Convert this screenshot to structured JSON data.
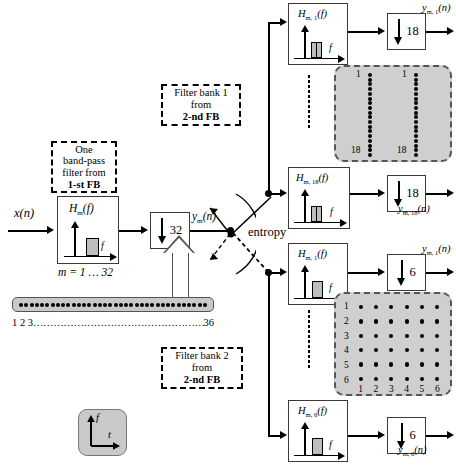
{
  "diagram": {
    "input_signal": "x(n)",
    "stage1": {
      "callout": {
        "line1": "One",
        "line2": "band-pass",
        "line3": "filter from",
        "line4": "1-st FB"
      },
      "filter_label": "H",
      "filter_sub": "m",
      "filter_arg": "(f)",
      "axis_f": "f",
      "index_note": "m = 1 … 32",
      "downsample": "32",
      "output": "y",
      "output_sub": "m",
      "output_arg": "(n)"
    },
    "switch": {
      "label": "entropy"
    },
    "bank1": {
      "callout": {
        "line1": "Filter bank 1",
        "line2": "from",
        "line3": "2-nd FB"
      },
      "branches": [
        {
          "filter_label": "H",
          "filter_sub": "m, 1",
          "filter_arg": "(f)",
          "axis_f": "f",
          "downsample": "18",
          "output_label": "y",
          "output_sub": "m, 1",
          "output_arg": "(n)"
        },
        {
          "filter_label": "H",
          "filter_sub": "m, 18",
          "filter_arg": "(f)",
          "axis_f": "f",
          "downsample": "18",
          "output_label": "y",
          "output_sub": "m, 18",
          "output_arg": "(n)"
        }
      ],
      "tiling": {
        "type": "columns",
        "columns": 2,
        "dots_per_column": 18,
        "col_top_label": "1",
        "col_bottom_label": "18"
      }
    },
    "bank2": {
      "callout": {
        "line1": "Filter bank 2",
        "line2": "from",
        "line3": "2-nd FB"
      },
      "branches": [
        {
          "filter_label": "H",
          "filter_sub": "m, 1",
          "filter_arg": "(f)",
          "axis_f": "f",
          "downsample": "6",
          "output_label": "y",
          "output_sub": "m, 1",
          "output_arg": "(n)"
        },
        {
          "filter_label": "H",
          "filter_sub": "m, 6",
          "filter_arg": "(f)",
          "axis_f": "f",
          "downsample": "6",
          "output_label": "y",
          "output_sub": "m, 6",
          "output_arg": "(n)"
        }
      ],
      "tiling": {
        "type": "grid",
        "rows": 6,
        "columns": 6,
        "row_labels": [
          "1",
          "2",
          "3",
          "4",
          "5",
          "6"
        ],
        "column_labels": [
          "1",
          "2",
          "3",
          "4",
          "5",
          "6"
        ]
      }
    },
    "channel_strip": {
      "dot_count": 36,
      "label_start": "1 2 3",
      "label_end": "36",
      "leader": "……………………………………………………………"
    },
    "ft_legend": {
      "y_axis": "f",
      "x_axis": "t"
    },
    "colors": {
      "grey_fill": "#cfcfcf",
      "strip_fill": "#c9c9c9",
      "bar_fill": "#bdbdbd",
      "line": "#000000",
      "box_border": "#3a3a3a"
    }
  }
}
